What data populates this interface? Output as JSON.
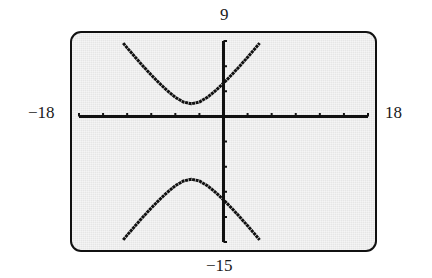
{
  "window": {
    "xmin": "−18",
    "xmax": "18",
    "ymin": "−15",
    "ymax": "9"
  },
  "colors": {
    "screen_bg": "#e6e6e6",
    "ink": "#111111",
    "frame": "#111111"
  },
  "chart_data": {
    "type": "line",
    "title": "",
    "xlabel": "",
    "ylabel": "",
    "xlim": [
      -18,
      18
    ],
    "ylim": [
      -15,
      9
    ],
    "xscl": 3,
    "yscl": 3,
    "grid": false,
    "legend": null,
    "annotations": [
      "9",
      "−15",
      "−18",
      "18"
    ],
    "equation": "(y+3)^2/25 - (x+4)^2/16 = 1",
    "series": [
      {
        "name": "upper branch",
        "x": [
          -12.5,
          -12,
          -11,
          -10,
          -9,
          -8,
          -7,
          -6,
          -5,
          -4,
          -3,
          -2,
          -1,
          0,
          1,
          2,
          3,
          4,
          4.5
        ],
        "y": [
          8.75,
          8.18,
          7.06,
          5.98,
          4.94,
          3.96,
          3.06,
          2.28,
          1.72,
          1.5,
          1.72,
          2.28,
          3.06,
          3.96,
          4.94,
          5.98,
          7.06,
          8.18,
          8.75
        ]
      },
      {
        "name": "lower branch",
        "x": [
          -12.5,
          -12,
          -11,
          -10,
          -9,
          -8,
          -7,
          -6,
          -5,
          -4,
          -3,
          -2,
          -1,
          0,
          1,
          2,
          3,
          4,
          4.5
        ],
        "y": [
          -14.75,
          -14.18,
          -13.06,
          -11.98,
          -10.94,
          -9.96,
          -9.06,
          -8.28,
          -7.72,
          -7.5,
          -7.72,
          -8.28,
          -9.06,
          -9.96,
          -10.94,
          -11.98,
          -13.06,
          -14.18,
          -14.75
        ]
      }
    ]
  }
}
